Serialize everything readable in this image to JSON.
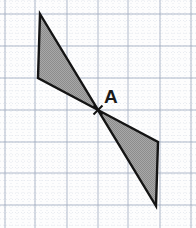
{
  "figure": {
    "width": 196,
    "height": 228,
    "background_color": "#fdfdfd"
  },
  "labels": {
    "center_point": "A"
  },
  "colors": {
    "grid_major": "#9aa6bb",
    "grid_minor": "#c3cbd8",
    "shape_fill": "#9d9d9d",
    "shape_stroke": "#141414",
    "label_color": "#1a1a1a",
    "marker_color": "#111111"
  },
  "grid": {
    "major_x": [
      5,
      35,
      67,
      98,
      128,
      160,
      191
    ],
    "major_y": [
      14,
      46,
      78,
      110,
      142,
      173,
      205
    ],
    "minor_step_x": 6,
    "minor_step_y": 6.4,
    "major_stroke_width": 0.9,
    "minor_stroke_width": 0.5
  },
  "chart_data": {
    "type": "scatter",
    "xlabel": "",
    "ylabel": "",
    "center_of_symmetry": {
      "label": "A",
      "x": 98,
      "y": 110
    },
    "shapes": [
      {
        "name": "upper-triangle",
        "fill": "#9d9d9d",
        "stroke": "#141414",
        "points": [
          [
            40,
            14
          ],
          [
            38,
            78
          ],
          [
            98,
            110
          ]
        ]
      },
      {
        "name": "lower-triangle",
        "fill": "#9d9d9d",
        "stroke": "#141414",
        "points": [
          [
            156,
            206
          ],
          [
            158,
            142
          ],
          [
            98,
            110
          ]
        ]
      }
    ],
    "marker": {
      "name": "center-cross",
      "x": 98,
      "y": 110,
      "size": 9
    }
  }
}
